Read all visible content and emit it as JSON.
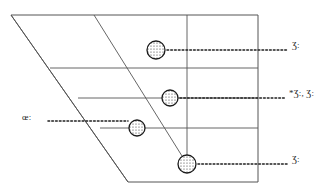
{
  "figure": {
    "type": "annotated-geometric-diagram",
    "background_color": "#ffffff",
    "line_color": "#555555",
    "marker_color": "#1a1a1a",
    "text_color": "#2b2b2b",
    "width": 336,
    "height": 192
  },
  "shape": {
    "name": "parallelogram-outline",
    "vertices": [
      {
        "x": 11,
        "y": 15
      },
      {
        "x": 258,
        "y": 15
      },
      {
        "x": 258,
        "y": 182
      },
      {
        "x": 128,
        "y": 182
      }
    ]
  },
  "grid": {
    "horizontal_lines": [
      {
        "name": "grid-line-1",
        "x1": 50,
        "y1": 68,
        "x2": 258,
        "y2": 68
      },
      {
        "name": "grid-line-2",
        "x1": 78,
        "y1": 98,
        "x2": 258,
        "y2": 98
      },
      {
        "name": "grid-line-3",
        "x1": 100,
        "y1": 128,
        "x2": 258,
        "y2": 128
      }
    ],
    "slant_lines": [
      {
        "name": "slant-line-left",
        "x1": 11,
        "y1": 15,
        "x2": 128,
        "y2": 182
      },
      {
        "name": "slant-line-right",
        "x1": 94,
        "y1": 15,
        "x2": 187,
        "y2": 164
      }
    ],
    "vertical_lines": [
      {
        "name": "vertical-axis-line",
        "x1": 187,
        "y1": 15,
        "x2": 187,
        "y2": 164
      }
    ]
  },
  "markers": [
    {
      "name": "marker-1",
      "x": 156,
      "y": 50,
      "r": 9,
      "fill": "stipple"
    },
    {
      "name": "marker-2",
      "x": 170,
      "y": 98,
      "r": 8,
      "fill": "stipple"
    },
    {
      "name": "marker-3",
      "x": 137,
      "y": 128,
      "r": 8,
      "fill": "stipple"
    },
    {
      "name": "marker-4",
      "x": 187,
      "y": 164,
      "r": 9,
      "fill": "stipple"
    }
  ],
  "leaders": [
    {
      "name": "leader-line-1",
      "x1": 167,
      "y1": 50,
      "x2": 288,
      "y2": 50
    },
    {
      "name": "leader-line-2",
      "x1": 180,
      "y1": 98,
      "x2": 286,
      "y2": 98
    },
    {
      "name": "leader-line-3",
      "x1": 48,
      "y1": 121,
      "x2": 128,
      "y2": 121
    },
    {
      "name": "leader-line-4",
      "x1": 198,
      "y1": 164,
      "x2": 288,
      "y2": 164
    }
  ],
  "labels": {
    "right_1": "Ʒ:",
    "right_2": "*Ʒ:, Ʒ:",
    "right_3": "Ʒ:",
    "left_1": "œ:"
  }
}
